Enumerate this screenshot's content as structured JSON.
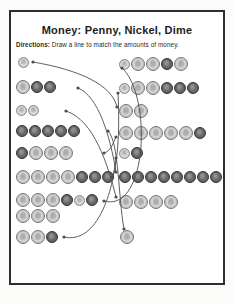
{
  "page": {
    "title": "Money: Penny, Nickel, Dime",
    "directions_label": "Directions:",
    "directions_text": " Draw a line to match the amounts of money."
  },
  "colors": {
    "page_bg": "#ffffff",
    "frame_border": "#2e2e2e",
    "line_color": "#4d4d4d",
    "penny_fill": "#6c6c6c",
    "nickel_fill": "#d7d7d7",
    "dime_fill": "#dedede"
  },
  "left_rows": [
    {
      "coins": [
        "dime"
      ],
      "x": 18,
      "y": 62
    },
    {
      "coins": [
        "nickel",
        "penny",
        "penny"
      ],
      "x": 16,
      "y": 87
    },
    {
      "coins": [
        "dime",
        "dime"
      ],
      "x": 16,
      "y": 110
    },
    {
      "coins": [
        "penny",
        "penny",
        "penny",
        "penny",
        "penny"
      ],
      "x": 16,
      "y": 131
    },
    {
      "coins": [
        "penny",
        "nickel",
        "nickel",
        "nickel"
      ],
      "x": 16,
      "y": 153
    },
    {
      "coins": [
        "nickel",
        "nickel",
        "nickel",
        "nickel",
        "penny",
        "penny",
        "penny"
      ],
      "x": 16,
      "y": 177
    },
    {
      "coins": [
        "nickel",
        "nickel",
        "nickel",
        "penny",
        "dime",
        "penny"
      ],
      "x": 16,
      "y": 200
    },
    {
      "coins": [
        "nickel",
        "nickel",
        "nickel"
      ],
      "x": 16,
      "y": 216
    },
    {
      "coins": [
        "nickel",
        "nickel",
        "penny"
      ],
      "x": 16,
      "y": 237
    }
  ],
  "right_rows": [
    {
      "coins": [
        "dime",
        "nickel",
        "nickel",
        "penny",
        "nickel"
      ],
      "x": 119,
      "y": 64
    },
    {
      "coins": [
        "dime",
        "nickel",
        "nickel",
        "penny",
        "penny",
        "penny"
      ],
      "x": 119,
      "y": 88
    },
    {
      "coins": [
        "nickel",
        "nickel"
      ],
      "x": 119,
      "y": 111
    },
    {
      "coins": [
        "nickel",
        "nickel",
        "nickel",
        "nickel",
        "nickel",
        "penny"
      ],
      "x": 119,
      "y": 133
    },
    {
      "coins": [
        "dime",
        "penny"
      ],
      "x": 119,
      "y": 153
    },
    {
      "coins": [
        "penny",
        "penny",
        "penny",
        "penny",
        "penny",
        "penny",
        "penny",
        "penny"
      ],
      "x": 119,
      "y": 177
    },
    {
      "coins": [
        "nickel",
        "nickel",
        "nickel",
        "nickel"
      ],
      "x": 119,
      "y": 202
    },
    {
      "coins": [
        "nickel"
      ],
      "x": 120,
      "y": 237
    }
  ],
  "connections": [
    {
      "from": [
        33,
        62
      ],
      "c1": [
        80,
        70
      ],
      "c2": [
        112,
        85
      ],
      "to": [
        117,
        107
      ]
    },
    {
      "from": [
        78,
        88
      ],
      "c1": [
        98,
        96
      ],
      "c2": [
        110,
        135
      ],
      "to": [
        116,
        172
      ]
    },
    {
      "from": [
        66,
        111
      ],
      "c1": [
        94,
        120
      ],
      "c2": [
        108,
        165
      ],
      "to": [
        116,
        197
      ]
    },
    {
      "from": [
        108,
        131
      ],
      "c1": [
        119,
        142
      ],
      "c2": [
        118,
        195
      ],
      "to": [
        124,
        229
      ]
    },
    {
      "from": [
        104,
        153
      ],
      "c1": [
        111,
        151
      ],
      "c2": [
        113,
        143
      ],
      "to": [
        116,
        137
      ]
    },
    {
      "from": [
        112,
        177
      ],
      "c1": [
        120,
        158
      ],
      "c2": [
        119,
        112
      ],
      "to": [
        118,
        93
      ]
    },
    {
      "from": [
        104,
        201
      ],
      "c1": [
        148,
        213
      ],
      "c2": [
        152,
        95
      ],
      "to": [
        122,
        68
      ]
    },
    {
      "from": [
        64,
        237
      ],
      "c1": [
        95,
        244
      ],
      "c2": [
        112,
        198
      ],
      "to": [
        116,
        158
      ]
    }
  ]
}
